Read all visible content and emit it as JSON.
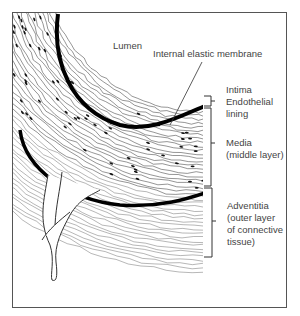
{
  "diagram": {
    "labels": {
      "lumen": "Lumen",
      "internal_elastic_membrane": "Internal elastic membrane",
      "intima": "Intima",
      "endothelial_1": "Endothelial",
      "endothelial_2": "lining",
      "media": "Media",
      "media_sub": "(middle layer)",
      "adventitia": "Adventitia",
      "adventitia_sub_1": "(outer layer",
      "adventitia_sub_2": "of connective",
      "adventitia_sub_3": "tissue)"
    },
    "colors": {
      "ink": "#111111",
      "text": "#444444",
      "frame": "#555555"
    }
  }
}
